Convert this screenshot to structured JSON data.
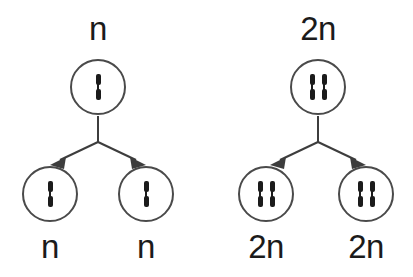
{
  "figure": {
    "background_color": "#ffffff",
    "stroke_color": "#3d3d3d",
    "chromosome_color": "#1b1b1b",
    "cell_outline_color": "#4a4a4a"
  },
  "diagrams": [
    {
      "id": "haploid",
      "parent": {
        "label": "n",
        "chromosome_count": 1
      },
      "daughters": [
        {
          "label": "n",
          "chromosome_count": 1
        },
        {
          "label": "n",
          "chromosome_count": 1
        }
      ]
    },
    {
      "id": "diploid",
      "parent": {
        "label": "2n",
        "chromosome_count": 2
      },
      "daughters": [
        {
          "label": "2n",
          "chromosome_count": 2
        },
        {
          "label": "2n",
          "chromosome_count": 2
        }
      ]
    }
  ]
}
